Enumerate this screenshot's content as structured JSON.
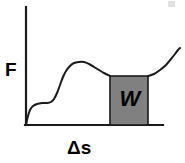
{
  "figure": {
    "type": "force-displacement-diagram",
    "background_color": "#ffffff",
    "line_color": "#1a1a1a",
    "axes": {
      "y_label": "F",
      "x_label": "Δs",
      "origin": {
        "x": 26,
        "y": 125
      },
      "y_axis_top": {
        "x": 26,
        "y": 7
      },
      "x_axis_right": {
        "x": 163,
        "y": 125
      },
      "stroke_width": 2.2,
      "color": "#1a1a1a"
    },
    "shaded_region": {
      "label": "W",
      "fill_color": "#808080",
      "stroke_color": "#1a1a1a",
      "x_left": 110,
      "x_right": 148,
      "y_top": 76,
      "y_bottom": 125
    },
    "corner_mark": {
      "name": "scan-artifact",
      "color": "#c9c9c9"
    }
  },
  "chart_data": {
    "type": "line",
    "title": "",
    "subtitle": "",
    "xlabel": "Δs",
    "ylabel": "F",
    "grid": false,
    "legend": null,
    "axis_arrows": false,
    "xlim": [
      0,
      185
    ],
    "ylim": [
      0,
      163
    ],
    "annotations": [
      {
        "text": "W",
        "meaning": "work done, area under force curve",
        "x_range": [
          110,
          148
        ],
        "y_range": [
          76,
          125
        ],
        "style": "gray filled rectangle with black italic bold label"
      }
    ],
    "series": [
      {
        "name": "Force vs displacement (left segment)",
        "comment": "pixel-space polyline, y measured downward from image top",
        "points": [
          [
            26,
            125
          ],
          [
            28,
            116
          ],
          [
            30,
            110
          ],
          [
            33,
            106
          ],
          [
            37,
            104
          ],
          [
            42,
            103
          ],
          [
            47,
            103
          ],
          [
            51,
            102
          ],
          [
            54,
            99
          ],
          [
            57,
            93
          ],
          [
            60,
            85
          ],
          [
            63,
            77
          ],
          [
            66,
            71
          ],
          [
            70,
            66
          ],
          [
            74,
            63
          ],
          [
            79,
            62
          ],
          [
            84,
            62
          ],
          [
            89,
            64
          ],
          [
            94,
            67
          ],
          [
            99,
            70
          ],
          [
            104,
            73
          ],
          [
            110,
            76
          ]
        ]
      },
      {
        "name": "Force vs displacement (right segment)",
        "comment": "resumes at right edge of shaded W block and rises",
        "points": [
          [
            148,
            76
          ],
          [
            154,
            74
          ],
          [
            160,
            70
          ],
          [
            166,
            65
          ],
          [
            171,
            59
          ],
          [
            175,
            54
          ],
          [
            178,
            50
          ],
          [
            180,
            48
          ]
        ]
      }
    ]
  }
}
